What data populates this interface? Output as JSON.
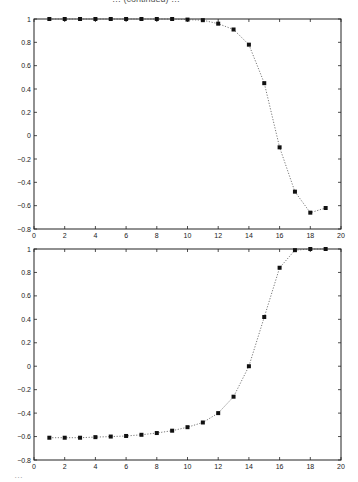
{
  "page": {
    "top_fragment": "… (continued) …",
    "bottom_fragment": "…"
  },
  "chart_data": [
    {
      "type": "line",
      "title": "",
      "xlabel": "",
      "ylabel": "",
      "xlim": [
        0,
        20
      ],
      "ylim": [
        -0.8,
        1
      ],
      "xticks": [
        0,
        2,
        4,
        6,
        8,
        10,
        12,
        14,
        16,
        18,
        20
      ],
      "yticks": [
        -0.8,
        -0.6,
        -0.4,
        -0.2,
        0,
        0.2,
        0.4,
        0.6,
        0.8,
        1
      ],
      "grid": false,
      "line_style": "dotted",
      "marker": "filled-square",
      "x": [
        1,
        2,
        3,
        4,
        5,
        6,
        7,
        8,
        9,
        10,
        11,
        12,
        13,
        14,
        15,
        16,
        17,
        18,
        19
      ],
      "series": [
        {
          "name": "series-1",
          "values": [
            1.0,
            1.0,
            1.0,
            1.0,
            1.0,
            1.0,
            1.0,
            1.0,
            1.0,
            0.995,
            0.99,
            0.96,
            0.91,
            0.78,
            0.45,
            -0.1,
            -0.48,
            -0.66,
            -0.62
          ]
        }
      ]
    },
    {
      "type": "line",
      "title": "",
      "xlabel": "",
      "ylabel": "",
      "xlim": [
        0,
        20
      ],
      "ylim": [
        -0.8,
        1
      ],
      "xticks": [
        0,
        2,
        4,
        6,
        8,
        10,
        12,
        14,
        16,
        18,
        20
      ],
      "yticks": [
        -0.8,
        -0.6,
        -0.4,
        -0.2,
        0,
        0.2,
        0.4,
        0.6,
        0.8,
        1
      ],
      "grid": false,
      "line_style": "dotted",
      "marker": "filled-square",
      "x": [
        1,
        2,
        3,
        4,
        5,
        6,
        7,
        8,
        9,
        10,
        11,
        12,
        13,
        14,
        15,
        16,
        17,
        18,
        19
      ],
      "series": [
        {
          "name": "series-1",
          "values": [
            -0.61,
            -0.61,
            -0.61,
            -0.605,
            -0.6,
            -0.595,
            -0.585,
            -0.57,
            -0.55,
            -0.52,
            -0.48,
            -0.4,
            -0.26,
            0.0,
            0.42,
            0.84,
            0.99,
            1.0,
            1.0
          ]
        }
      ]
    }
  ],
  "layout": {
    "panels": [
      {
        "left": 34,
        "right": 341,
        "top": 19,
        "bottom": 229
      },
      {
        "left": 34,
        "right": 341,
        "top": 249,
        "bottom": 460
      }
    ],
    "colors": {
      "axis": "#222222",
      "line": "#555555",
      "marker": "#111111"
    }
  }
}
